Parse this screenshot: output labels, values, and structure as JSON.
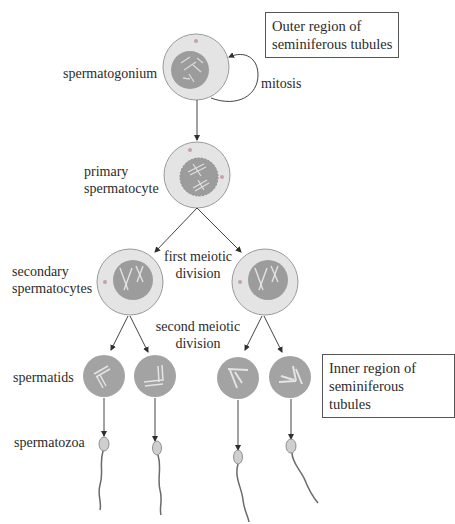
{
  "diagram": {
    "stages": {
      "spermatogonium": "spermatogonium",
      "primary_spermatocyte": [
        "primary",
        "spermatocyte"
      ],
      "secondary_spermatocytes": [
        "secondary",
        "spermatocytes"
      ],
      "spermatids": "spermatids",
      "spermatozoa": "spermatozoa"
    },
    "processes": {
      "mitosis": "mitosis",
      "first_meiotic_division": [
        "first meiotic",
        "division"
      ],
      "second_meiotic_division": [
        "second meiotic",
        "division"
      ]
    },
    "regions": {
      "outer": [
        "Outer region of",
        "seminiferous tubules"
      ],
      "inner": [
        "Inner region of",
        "seminiferous tubules"
      ]
    },
    "colors": {
      "cytoplasm": "#e4e4e4",
      "cell_border": "#9a9a9a",
      "nucleus": "#9c9c9c",
      "spermatid": "#a3a3a3",
      "centriole": "#c9a0a8",
      "line": "#3a3a3a"
    }
  }
}
